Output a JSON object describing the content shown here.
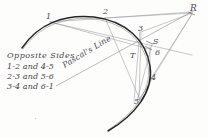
{
  "figure": {
    "title_text": "Pascal's Line",
    "background_color": "#fdfdfc",
    "ink_color": "#2b2b2b",
    "construction_line_color": "#8d8d96",
    "legend": {
      "heading": "Opposite Sides",
      "lines": [
        "1-2 and 4-5",
        "2-3 and 5-6",
        "3-4 and 6-1"
      ]
    },
    "point_labels": [
      {
        "name": "point-1",
        "text": "1",
        "x": 46,
        "y": 13
      },
      {
        "name": "point-2",
        "text": "2",
        "x": 103,
        "y": 8
      },
      {
        "name": "point-3",
        "text": "3",
        "x": 138,
        "y": 25
      },
      {
        "name": "point-4",
        "text": "4",
        "x": 151,
        "y": 74
      },
      {
        "name": "point-5",
        "text": "5",
        "x": 134,
        "y": 98
      },
      {
        "name": "point-6",
        "text": "6",
        "x": 155,
        "y": 49
      },
      {
        "name": "intersection-R",
        "text": "R",
        "x": 190,
        "y": 4
      },
      {
        "name": "intersection-S",
        "text": "S",
        "x": 153,
        "y": 38
      },
      {
        "name": "intersection-T",
        "text": "T",
        "x": 130,
        "y": 52
      }
    ],
    "conic": {
      "type": "conic-section",
      "description": "hand-drawn parabola opening toward lower-left",
      "path": "M 22,48 C 38,24 64,14 94,17 C 126,21 146,40 150,66 C 154,92 134,116 108,131"
    },
    "chords": [
      {
        "name": "chord-1-2",
        "from": "1",
        "to": "2"
      },
      {
        "name": "chord-2-3",
        "from": "2",
        "to": "3"
      },
      {
        "name": "chord-3-4",
        "from": "3",
        "to": "4"
      },
      {
        "name": "chord-4-5",
        "from": "4",
        "to": "5"
      },
      {
        "name": "chord-5-6",
        "from": "5",
        "to": "6"
      },
      {
        "name": "chord-6-1",
        "from": "6",
        "to": "1"
      }
    ]
  }
}
